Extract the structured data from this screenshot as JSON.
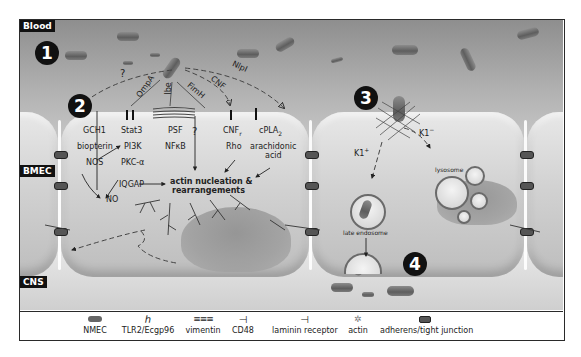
{
  "regions": {
    "blood": "Blood",
    "bmec": "BMEC",
    "cns": "CNS"
  },
  "steps": [
    "1",
    "2",
    "3",
    "4"
  ],
  "ligands": {
    "question": "?",
    "ompA": "OmpA",
    "ibe": "Ibe",
    "fimH": "FimH",
    "cnf": "CNF",
    "nlpI": "NlpI"
  },
  "pathways": {
    "col1": [
      "GCH1",
      "biopterin",
      "NOS"
    ],
    "col2": [
      "Stat3",
      "PI3K",
      "PKC-α",
      "IQGAP"
    ],
    "col3": [
      "PSF",
      "NFκB"
    ],
    "col4": [
      "?"
    ],
    "col5": [
      "CNF",
      "Rho"
    ],
    "col5_sub": "r",
    "col6": [
      "cPLA",
      "arachidonic",
      "acid"
    ],
    "col6_sub": "2",
    "no": "NO",
    "actin1": "actin nucleation &",
    "actin2": "rearrangements"
  },
  "right_cell": {
    "k1_minus": "K1",
    "k1_minus_sup": "−",
    "k1_plus": "K1",
    "k1_plus_sup": "+",
    "lysosome": "lysosome",
    "late_endosome": "late endosome"
  },
  "legend": {
    "items": [
      {
        "icon": "nmec-icon",
        "label": "NMEC"
      },
      {
        "icon": "tlr2-receptor-icon",
        "label": "TLR2/Ecgp96"
      },
      {
        "icon": "vimentin-icon",
        "label": "vimentin"
      },
      {
        "icon": "cd48-icon",
        "label": "CD48"
      },
      {
        "icon": "laminin-receptor-icon",
        "label": "laminin  receptor"
      },
      {
        "icon": "actin-icon",
        "label": "actin"
      },
      {
        "icon": "junction-icon",
        "label": "adherens/tight junction"
      }
    ]
  },
  "colors": {
    "frame": "#2a2a2a",
    "label_bg": "#111111",
    "cell": "#d2d2d2",
    "nucleus": "#9a9a9a",
    "bacterium": "#6e6e6e"
  }
}
